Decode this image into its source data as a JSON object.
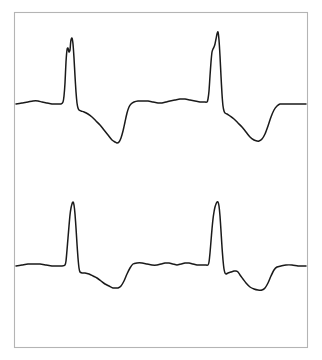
{
  "figure": {
    "title": "",
    "background_color": "#ffffff",
    "frame_color": "#b4b4b4",
    "trace_color": "#1a1a1a",
    "width_px": 322,
    "height_px": 360
  },
  "chart_data": {
    "type": "line",
    "title": "",
    "subtitle": "",
    "xlabel": "",
    "ylabel": "",
    "xlim": [
      0,
      322
    ],
    "ylim": [
      360,
      0
    ],
    "grid": false,
    "legend": false,
    "legend_position": "none",
    "axes_visible": false,
    "tick_labels_x": [],
    "tick_labels_y": [],
    "annotations": [],
    "plot_area": {
      "x": 14,
      "y": 12,
      "width": 294,
      "height": 336
    },
    "series": [
      {
        "name": "ecg-lead-upper",
        "baseline_y": 104,
        "color": "#1a1a1a",
        "beats": 2,
        "features": [
          {
            "label": "P-wave-1",
            "x": 40,
            "y": 101
          },
          {
            "label": "R-notch-1",
            "x": 67,
            "y": 48
          },
          {
            "label": "R-peak-1",
            "x": 72,
            "y": 38
          },
          {
            "label": "S-trough-1",
            "x": 79,
            "y": 110
          },
          {
            "label": "T-trough-1",
            "x": 117,
            "y": 143
          },
          {
            "label": "P-wave-2",
            "x": 188,
            "y": 100
          },
          {
            "label": "R-notch-2",
            "x": 212,
            "y": 52
          },
          {
            "label": "R-peak-2",
            "x": 218,
            "y": 32
          },
          {
            "label": "S-trough-2",
            "x": 225,
            "y": 113
          },
          {
            "label": "T-trough-2",
            "x": 259,
            "y": 141
          }
        ],
        "points": [
          [
            16,
            104
          ],
          [
            22,
            103
          ],
          [
            28,
            102
          ],
          [
            33,
            101
          ],
          [
            38,
            101
          ],
          [
            42,
            102
          ],
          [
            47,
            103
          ],
          [
            52,
            104
          ],
          [
            57,
            104
          ],
          [
            61,
            104
          ],
          [
            63,
            102
          ],
          [
            64,
            96
          ],
          [
            65,
            83
          ],
          [
            66,
            62
          ],
          [
            67,
            50
          ],
          [
            68,
            48
          ],
          [
            69,
            52
          ],
          [
            70,
            50
          ],
          [
            70.5,
            44
          ],
          [
            71,
            40
          ],
          [
            72,
            38
          ],
          [
            73,
            44
          ],
          [
            74,
            58
          ],
          [
            75,
            76
          ],
          [
            76,
            92
          ],
          [
            77,
            103
          ],
          [
            78,
            108
          ],
          [
            79,
            110
          ],
          [
            81,
            111
          ],
          [
            84,
            112
          ],
          [
            88,
            114
          ],
          [
            92,
            117
          ],
          [
            96,
            121
          ],
          [
            100,
            125
          ],
          [
            104,
            130
          ],
          [
            108,
            135
          ],
          [
            112,
            140
          ],
          [
            115,
            142
          ],
          [
            117,
            143
          ],
          [
            119,
            142
          ],
          [
            121,
            138
          ],
          [
            123,
            131
          ],
          [
            125,
            122
          ],
          [
            127,
            113
          ],
          [
            129,
            107
          ],
          [
            131,
            104
          ],
          [
            134,
            102
          ],
          [
            138,
            101
          ],
          [
            143,
            101
          ],
          [
            148,
            101
          ],
          [
            153,
            102
          ],
          [
            158,
            103
          ],
          [
            162,
            103
          ],
          [
            166,
            102
          ],
          [
            170,
            101
          ],
          [
            175,
            100
          ],
          [
            180,
            99
          ],
          [
            185,
            99
          ],
          [
            190,
            100
          ],
          [
            195,
            101
          ],
          [
            200,
            102
          ],
          [
            204,
            102
          ],
          [
            207,
            102
          ],
          [
            208,
            99
          ],
          [
            209,
            91
          ],
          [
            210,
            76
          ],
          [
            211,
            62
          ],
          [
            212,
            52
          ],
          [
            213,
            49
          ],
          [
            214,
            47
          ],
          [
            215,
            44
          ],
          [
            216,
            39
          ],
          [
            217,
            34
          ],
          [
            218,
            32
          ],
          [
            219,
            40
          ],
          [
            220,
            56
          ],
          [
            221,
            76
          ],
          [
            222,
            94
          ],
          [
            223,
            106
          ],
          [
            224,
            111
          ],
          [
            225,
            113
          ],
          [
            227,
            114
          ],
          [
            230,
            116
          ],
          [
            234,
            119
          ],
          [
            238,
            123
          ],
          [
            242,
            127
          ],
          [
            246,
            132
          ],
          [
            250,
            137
          ],
          [
            254,
            140
          ],
          [
            257,
            141
          ],
          [
            259,
            141
          ],
          [
            262,
            139
          ],
          [
            265,
            134
          ],
          [
            268,
            126
          ],
          [
            271,
            117
          ],
          [
            274,
            110
          ],
          [
            277,
            106
          ],
          [
            280,
            104
          ],
          [
            284,
            104
          ],
          [
            290,
            104
          ],
          [
            296,
            104
          ],
          [
            302,
            104
          ],
          [
            306,
            104
          ]
        ]
      },
      {
        "name": "ecg-lead-lower",
        "baseline_y": 266,
        "color": "#1a1a1a",
        "beats": 2,
        "features": [
          {
            "label": "P-wave-1",
            "x": 40,
            "y": 264
          },
          {
            "label": "R-peak-1",
            "x": 73,
            "y": 202
          },
          {
            "label": "S-trough-1",
            "x": 80,
            "y": 272
          },
          {
            "label": "T-trough-1",
            "x": 118,
            "y": 288
          },
          {
            "label": "P-wave-2",
            "x": 186,
            "y": 263
          },
          {
            "label": "R-peak-2",
            "x": 218,
            "y": 202
          },
          {
            "label": "S-trough-2",
            "x": 226,
            "y": 274
          },
          {
            "label": "S-notch-2",
            "x": 238,
            "y": 272
          },
          {
            "label": "T-trough-2",
            "x": 262,
            "y": 290
          }
        ],
        "points": [
          [
            16,
            266
          ],
          [
            22,
            265
          ],
          [
            28,
            264
          ],
          [
            34,
            264
          ],
          [
            40,
            264
          ],
          [
            46,
            265
          ],
          [
            52,
            266
          ],
          [
            58,
            266
          ],
          [
            62,
            266
          ],
          [
            65,
            265
          ],
          [
            66,
            261
          ],
          [
            67,
            250
          ],
          [
            68,
            238
          ],
          [
            69,
            226
          ],
          [
            70,
            215
          ],
          [
            71,
            208
          ],
          [
            72,
            204
          ],
          [
            73,
            202
          ],
          [
            74,
            205
          ],
          [
            75,
            214
          ],
          [
            76,
            228
          ],
          [
            77,
            244
          ],
          [
            78,
            258
          ],
          [
            79,
            268
          ],
          [
            80,
            272
          ],
          [
            82,
            273
          ],
          [
            85,
            273
          ],
          [
            89,
            274
          ],
          [
            93,
            276
          ],
          [
            97,
            278
          ],
          [
            101,
            281
          ],
          [
            105,
            284
          ],
          [
            109,
            286
          ],
          [
            113,
            288
          ],
          [
            116,
            288
          ],
          [
            118,
            288
          ],
          [
            121,
            286
          ],
          [
            124,
            281
          ],
          [
            127,
            274
          ],
          [
            130,
            268
          ],
          [
            133,
            264
          ],
          [
            137,
            263
          ],
          [
            142,
            263
          ],
          [
            147,
            264
          ],
          [
            152,
            265
          ],
          [
            157,
            265
          ],
          [
            161,
            264
          ],
          [
            165,
            263
          ],
          [
            169,
            263
          ],
          [
            173,
            264
          ],
          [
            177,
            265
          ],
          [
            181,
            264
          ],
          [
            185,
            263
          ],
          [
            189,
            263
          ],
          [
            193,
            264
          ],
          [
            197,
            265
          ],
          [
            201,
            265
          ],
          [
            205,
            265
          ],
          [
            208,
            265
          ],
          [
            209,
            262
          ],
          [
            210,
            253
          ],
          [
            211,
            241
          ],
          [
            212,
            229
          ],
          [
            213,
            219
          ],
          [
            214,
            212
          ],
          [
            215,
            207
          ],
          [
            216,
            204
          ],
          [
            217,
            202
          ],
          [
            218,
            202
          ],
          [
            219,
            206
          ],
          [
            220,
            216
          ],
          [
            221,
            231
          ],
          [
            222,
            247
          ],
          [
            223,
            260
          ],
          [
            224,
            269
          ],
          [
            225,
            273
          ],
          [
            226,
            274
          ],
          [
            228,
            273
          ],
          [
            231,
            272
          ],
          [
            234,
            271
          ],
          [
            236,
            271
          ],
          [
            238,
            272
          ],
          [
            240,
            275
          ],
          [
            243,
            279
          ],
          [
            246,
            283
          ],
          [
            250,
            287
          ],
          [
            254,
            289
          ],
          [
            258,
            290
          ],
          [
            262,
            290
          ],
          [
            265,
            288
          ],
          [
            268,
            283
          ],
          [
            271,
            276
          ],
          [
            274,
            270
          ],
          [
            277,
            267
          ],
          [
            281,
            266
          ],
          [
            286,
            265
          ],
          [
            292,
            265
          ],
          [
            298,
            266
          ],
          [
            303,
            266
          ],
          [
            306,
            266
          ]
        ]
      }
    ]
  }
}
